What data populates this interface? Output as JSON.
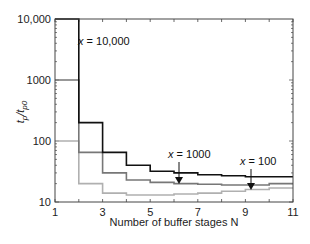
{
  "chart_data": {
    "type": "line",
    "step": true,
    "title": "",
    "xlabel": "Number of buffer stages N",
    "ylabel": "tp/tp0",
    "xlim": [
      1,
      11
    ],
    "ylim": [
      10,
      10000
    ],
    "yscale": "log",
    "xticks": [
      1,
      3,
      5,
      7,
      9,
      11
    ],
    "yticks": [
      10,
      100,
      1000,
      10000
    ],
    "ytick_labels": [
      "10",
      "100",
      "1000",
      "10,000"
    ],
    "grid": false,
    "x": [
      1,
      2,
      3,
      4,
      5,
      6,
      7,
      8,
      9,
      10
    ],
    "series": [
      {
        "name": "x = 10,000",
        "color": "#111111",
        "values": [
          10000,
          200,
          65,
          40,
          32,
          30,
          28,
          27,
          26,
          26
        ]
      },
      {
        "name": "x = 1000",
        "color": "#777777",
        "values": [
          1000,
          65,
          30,
          23,
          21,
          20,
          19.5,
          19,
          19,
          20
        ]
      },
      {
        "name": "x = 100",
        "color": "#b0b0b0",
        "values": [
          100,
          20,
          14,
          13,
          13,
          13.5,
          14,
          15,
          16,
          17
        ]
      }
    ],
    "annotations": [
      {
        "text": "x = 10,000",
        "x": 2.2,
        "y": 5000
      },
      {
        "text": "x = 1000",
        "x": 6.2,
        "y": 19.5,
        "arrow": true
      },
      {
        "text": "x = 100",
        "x": 9.2,
        "y": 15.5,
        "arrow": true
      }
    ]
  },
  "labels": {
    "xlabel": "Number of buffer stages N",
    "ylabel_main": "t",
    "ylabel_sub1": "p",
    "ylabel_sub2": "p0",
    "annot_10000": "x = 10,000",
    "annot_1000": "x = 1000",
    "annot_100": "x = 100"
  }
}
